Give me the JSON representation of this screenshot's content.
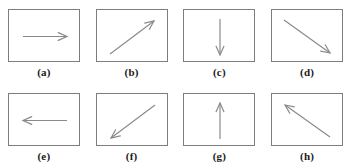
{
  "figure": {
    "title": "",
    "border_color": "#7d7d7d",
    "arrow_color": "#8a8a8a",
    "background_color": "#ffffff",
    "caption_color": "#1a1a1a",
    "rows": 2,
    "columns": 4
  },
  "chart_data": {
    "type": "diagram",
    "title": "",
    "xlabel": "",
    "ylabel": "",
    "categories": [
      "(a)",
      "(b)",
      "(c)",
      "(d)",
      "(e)",
      "(f)",
      "(g)",
      "(h)"
    ],
    "values": [
      0,
      45,
      90,
      135,
      180,
      225,
      270,
      315
    ],
    "units": "degrees",
    "legend": [],
    "grid": false
  },
  "panels": [
    {
      "label": "(a)",
      "icon": "arrow-right-icon",
      "direction": "right",
      "angle_deg": 0,
      "x1": 14,
      "y1": 26.5,
      "x2": 58,
      "y2": 26.5
    },
    {
      "label": "(b)",
      "icon": "arrow-up-right-icon",
      "direction": "up-right",
      "angle_deg": 45,
      "x1": 13,
      "y1": 44,
      "x2": 57,
      "y2": 11
    },
    {
      "label": "(c)",
      "icon": "arrow-down-icon",
      "direction": "down",
      "angle_deg": 270,
      "x1": 36,
      "y1": 9,
      "x2": 36,
      "y2": 45
    },
    {
      "label": "(d)",
      "icon": "arrow-down-right-icon",
      "direction": "down-right",
      "angle_deg": 315,
      "x1": 12,
      "y1": 10,
      "x2": 58,
      "y2": 43
    },
    {
      "label": "(e)",
      "icon": "arrow-left-icon",
      "direction": "left",
      "angle_deg": 180,
      "x1": 58,
      "y1": 26.5,
      "x2": 14,
      "y2": 26.5
    },
    {
      "label": "(f)",
      "icon": "arrow-down-left-icon",
      "direction": "down-left",
      "angle_deg": 225,
      "x1": 58,
      "y1": 11,
      "x2": 14,
      "y2": 44
    },
    {
      "label": "(g)",
      "icon": "arrow-up-icon",
      "direction": "up",
      "angle_deg": 90,
      "x1": 36,
      "y1": 45,
      "x2": 36,
      "y2": 9
    },
    {
      "label": "(h)",
      "icon": "arrow-up-left-icon",
      "direction": "up-left",
      "angle_deg": 135,
      "x1": 58,
      "y1": 43,
      "x2": 13,
      "y2": 11
    }
  ]
}
